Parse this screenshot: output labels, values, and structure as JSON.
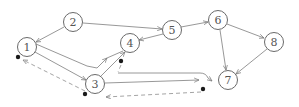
{
  "diagram": {
    "type": "directed-graph",
    "nodes": [
      {
        "id": "1",
        "label": "1",
        "x": 27,
        "y": 47
      },
      {
        "id": "2",
        "label": "2",
        "x": 73,
        "y": 22
      },
      {
        "id": "3",
        "label": "3",
        "x": 95,
        "y": 84
      },
      {
        "id": "4",
        "label": "4",
        "x": 130,
        "y": 43
      },
      {
        "id": "5",
        "label": "5",
        "x": 172,
        "y": 30
      },
      {
        "id": "6",
        "label": "6",
        "x": 218,
        "y": 20
      },
      {
        "id": "7",
        "label": "7",
        "x": 228,
        "y": 80
      },
      {
        "id": "8",
        "label": "8",
        "x": 274,
        "y": 42
      }
    ],
    "edges": [
      {
        "from": "2",
        "to": "1",
        "style": "solid"
      },
      {
        "from": "2",
        "to": "5",
        "style": "solid"
      },
      {
        "from": "5",
        "to": "4",
        "style": "solid"
      },
      {
        "from": "5",
        "to": "6",
        "style": "solid"
      },
      {
        "from": "6",
        "to": "8",
        "style": "solid"
      },
      {
        "from": "6",
        "to": "7",
        "style": "solid"
      },
      {
        "from": "8",
        "to": "7",
        "style": "solid"
      },
      {
        "from": "1",
        "to": "3",
        "style": "solid"
      },
      {
        "from": "1",
        "to": "4",
        "style": "solid",
        "routing": "bent"
      },
      {
        "from": "3",
        "to": "4",
        "style": "solid"
      },
      {
        "from": "3",
        "to": "7",
        "style": "solid",
        "routing": "curved"
      },
      {
        "from": "4",
        "to": "7",
        "style": "dashed",
        "note": "from dot below 4"
      },
      {
        "from": "7",
        "to": "3",
        "style": "dashed",
        "note": "from dot below-left of 7"
      },
      {
        "from": "3",
        "to": "1",
        "style": "dashed",
        "note": "from dot below-left of 3"
      }
    ],
    "colors": {
      "node_stroke": "#6a6a6a",
      "edge": "#8c8c8c",
      "dashed_edge": "#9a9a9a",
      "dot": "#1a1a1a",
      "background": "#ffffff"
    }
  }
}
